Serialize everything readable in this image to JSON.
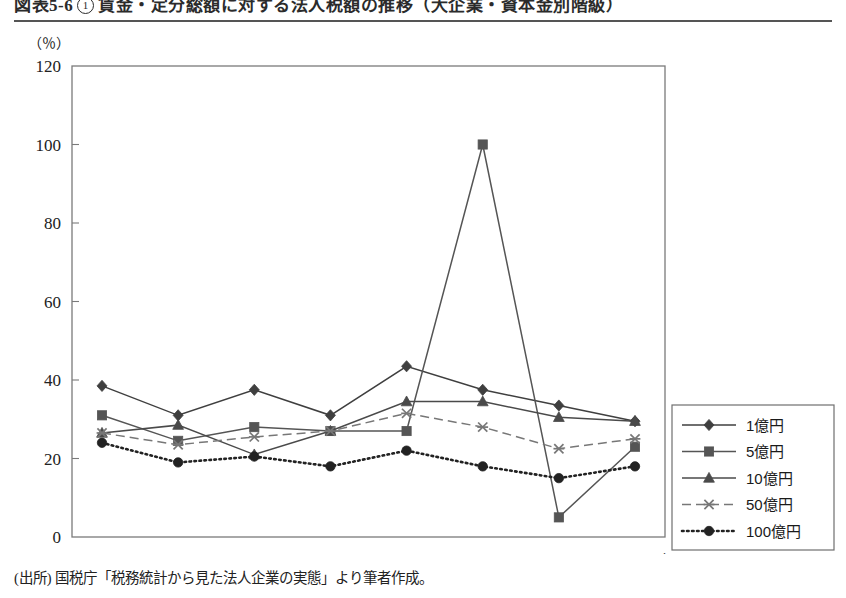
{
  "figure": {
    "title_prefix": "図表5-6",
    "title_number": "1",
    "title_text": "賃金・定分総額に対する法人税額の推移（大企業・資本金別階級）",
    "source_note": "(出所) 国税庁「税務統計から見た法人企業の実態」より筆者作成。"
  },
  "chart_data": {
    "type": "line",
    "title": "賃金・定分総額に対する法人税額の推移（大企業・資本金別階級）",
    "xlabel": "年",
    "ylabel": "（％）",
    "x_unit_label": "(年)",
    "y_unit_label": "（％）",
    "categories": [
      "2004",
      "2005",
      "2006",
      "2007",
      "2008",
      "2009",
      "2010",
      "2011"
    ],
    "ylim": [
      0,
      120
    ],
    "yticks": [
      0,
      20,
      40,
      60,
      80,
      100,
      120
    ],
    "grid": false,
    "legend_position": "right",
    "series": [
      {
        "name": "1億円",
        "marker": "diamond",
        "line_style": "solid",
        "color": "#3f3f3f",
        "values": [
          38.5,
          31.0,
          37.5,
          31.0,
          43.5,
          37.5,
          33.5,
          29.5
        ]
      },
      {
        "name": "5億円",
        "marker": "square",
        "line_style": "solid",
        "color": "#555555",
        "values": [
          31.0,
          24.5,
          28.0,
          27.0,
          27.0,
          100.0,
          5.0,
          23.0
        ]
      },
      {
        "name": "10億円",
        "marker": "triangle",
        "line_style": "solid",
        "color": "#4a4a4a",
        "values": [
          26.5,
          28.5,
          21.0,
          27.0,
          34.5,
          34.5,
          30.5,
          29.5
        ]
      },
      {
        "name": "50億円",
        "marker": "cross",
        "line_style": "dashed",
        "color": "#777777",
        "values": [
          26.5,
          23.5,
          25.5,
          27.0,
          31.5,
          28.0,
          22.5,
          25.0
        ]
      },
      {
        "name": "100億円",
        "marker": "circle",
        "line_style": "dotted",
        "color": "#222222",
        "values": [
          24.0,
          19.0,
          20.5,
          18.0,
          22.0,
          18.0,
          15.0,
          18.0
        ]
      }
    ]
  }
}
